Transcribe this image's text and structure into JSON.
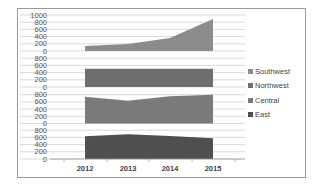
{
  "chart_data": {
    "type": "area",
    "layout": "stacked-panels",
    "title": "",
    "xlabel": "",
    "ylabel": "",
    "categories": [
      "2012",
      "2013",
      "2014",
      "2015"
    ],
    "series": [
      {
        "name": "Southwest",
        "values": [
          140,
          195,
          360,
          890
        ],
        "color": "#8c8c8c",
        "ylim": [
          0,
          1000
        ],
        "yticks": [
          0,
          200,
          400,
          600,
          800,
          1000
        ]
      },
      {
        "name": "Northwest",
        "values": [
          505,
          505,
          505,
          505
        ],
        "color": "#6e6e6e",
        "ylim": [
          0,
          800
        ],
        "yticks": [
          0,
          200,
          400,
          600,
          800
        ]
      },
      {
        "name": "Central",
        "values": [
          740,
          630,
          760,
          800
        ],
        "color": "#7a7a7a",
        "ylim": [
          0,
          800
        ],
        "yticks": [
          0,
          200,
          400,
          600,
          800
        ]
      },
      {
        "name": "East",
        "values": [
          630,
          685,
          640,
          575
        ],
        "color": "#4f4f4f",
        "ylim": [
          0,
          800
        ],
        "yticks": [
          0,
          200,
          400,
          600,
          800
        ]
      }
    ],
    "grid": true,
    "legend_position": "right"
  },
  "legend": {
    "items": [
      {
        "label": "Southwest",
        "color": "#8c8c8c"
      },
      {
        "label": "Northwest",
        "color": "#6e6e6e"
      },
      {
        "label": "Central",
        "color": "#7a7a7a"
      },
      {
        "label": "East",
        "color": "#4f4f4f"
      }
    ]
  }
}
